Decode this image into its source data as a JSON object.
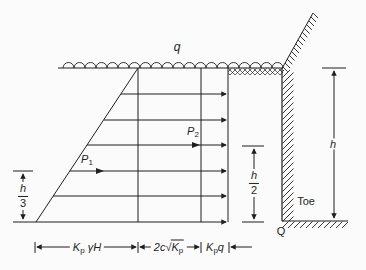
{
  "colors": {
    "line": "#1f1f1f",
    "background": "#fbfbfb"
  },
  "labels": {
    "surcharge": "q",
    "p1": {
      "base": "P",
      "sub": "1"
    },
    "p2": {
      "base": "P",
      "sub": "2"
    },
    "h_third": {
      "num": "h",
      "den": "3"
    },
    "h_half": {
      "num": "h",
      "den": "2"
    },
    "wall_height": "h",
    "toe": "Toe",
    "corner": "Q",
    "dim_triangle": {
      "base": "K",
      "sub": "p",
      "rest": "γH"
    },
    "dim_cohesion": {
      "coef": "2c",
      "radical": "√",
      "base": "K",
      "sub": "p"
    },
    "dim_surcharge": {
      "base": "K",
      "sub": "p",
      "rest": "q"
    }
  }
}
